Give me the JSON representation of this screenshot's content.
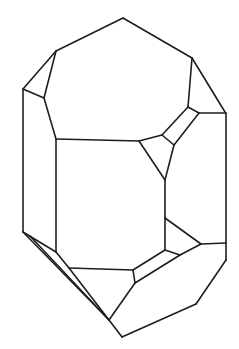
{
  "figure": {
    "type": "crystal-line-drawing",
    "stroke_color": "#1e1e1e",
    "background_color": "#ffffff",
    "edges": [
      [
        [
          123,
          18
        ],
        [
          56,
          51
        ]
      ],
      [
        [
          123,
          18
        ],
        [
          192,
          58
        ]
      ],
      [
        [
          56,
          51
        ],
        [
          23,
          89
        ]
      ],
      [
        [
          56,
          51
        ],
        [
          44,
          98
        ]
      ],
      [
        [
          23,
          89
        ],
        [
          44,
          98
        ]
      ],
      [
        [
          44,
          98
        ],
        [
          56,
          139
        ]
      ],
      [
        [
          56,
          139
        ],
        [
          139,
          141
        ]
      ],
      [
        [
          139,
          141
        ],
        [
          162,
          135
        ]
      ],
      [
        [
          162,
          135
        ],
        [
          188,
          107
        ]
      ],
      [
        [
          192,
          58
        ],
        [
          188,
          107
        ]
      ],
      [
        [
          192,
          58
        ],
        [
          225,
          112
        ]
      ],
      [
        [
          188,
          107
        ],
        [
          199,
          113
        ]
      ],
      [
        [
          199,
          113
        ],
        [
          174,
          145
        ]
      ],
      [
        [
          162,
          135
        ],
        [
          174,
          145
        ]
      ],
      [
        [
          199,
          113
        ],
        [
          226,
          113
        ]
      ],
      [
        [
          139,
          141
        ],
        [
          165,
          180
        ]
      ],
      [
        [
          174,
          145
        ],
        [
          165,
          180
        ]
      ],
      [
        [
          23,
          89
        ],
        [
          23,
          232
        ]
      ],
      [
        [
          56,
          139
        ],
        [
          56,
          252
        ]
      ],
      [
        [
          226,
          113
        ],
        [
          226,
          260
        ]
      ],
      [
        [
          165,
          180
        ],
        [
          165,
          218
        ]
      ],
      [
        [
          23,
          232
        ],
        [
          56,
          252
        ]
      ],
      [
        [
          23,
          232
        ],
        [
          109,
          320
        ]
      ],
      [
        [
          30,
          236
        ],
        [
          109,
          320
        ]
      ],
      [
        [
          56,
          252
        ],
        [
          69,
          268
        ]
      ],
      [
        [
          69,
          268
        ],
        [
          133,
          270
        ]
      ],
      [
        [
          133,
          270
        ],
        [
          135,
          283
        ]
      ],
      [
        [
          133,
          270
        ],
        [
          165,
          250
        ]
      ],
      [
        [
          165,
          250
        ],
        [
          180,
          255
        ]
      ],
      [
        [
          135,
          283
        ],
        [
          180,
          255
        ]
      ],
      [
        [
          165,
          218
        ],
        [
          165,
          250
        ]
      ],
      [
        [
          165,
          218
        ],
        [
          201,
          244
        ]
      ],
      [
        [
          180,
          255
        ],
        [
          201,
          244
        ]
      ],
      [
        [
          201,
          244
        ],
        [
          226,
          243
        ]
      ],
      [
        [
          226,
          260
        ],
        [
          196,
          304
        ]
      ],
      [
        [
          196,
          304
        ],
        [
          122,
          337
        ]
      ],
      [
        [
          122,
          337
        ],
        [
          109,
          320
        ]
      ],
      [
        [
          135,
          283
        ],
        [
          109,
          320
        ]
      ],
      [
        [
          69,
          268
        ],
        [
          109,
          320
        ]
      ]
    ]
  }
}
